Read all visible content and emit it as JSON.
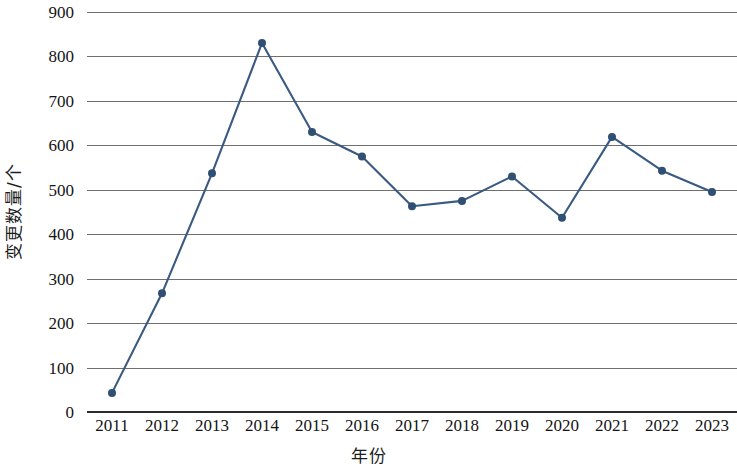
{
  "chart_data": {
    "type": "line",
    "title": "",
    "xlabel": "年份",
    "ylabel": "变更数量/个",
    "categories": [
      "2011",
      "2012",
      "2013",
      "2014",
      "2015",
      "2016",
      "2017",
      "2018",
      "2019",
      "2020",
      "2021",
      "2022",
      "2023"
    ],
    "values": [
      43,
      267,
      537,
      830,
      630,
      575,
      463,
      475,
      530,
      437,
      619,
      543,
      495
    ],
    "series": [
      {
        "name": "变更数量",
        "values": [
          43,
          267,
          537,
          830,
          630,
          575,
          463,
          475,
          530,
          437,
          619,
          543,
          495
        ]
      }
    ],
    "ylim": [
      0,
      900
    ],
    "ytick_labels": [
      "0",
      "100",
      "200",
      "300",
      "400",
      "500",
      "600",
      "700",
      "800",
      "900"
    ],
    "ytick_values": [
      0,
      100,
      200,
      300,
      400,
      500,
      600,
      700,
      800,
      900
    ],
    "ystep": 100,
    "grid": "horizontal",
    "legend": "none",
    "marker": "circle",
    "colors": {
      "line": "#3a5a82",
      "marker": "#2f4f73",
      "gridline": "#6f6f6f",
      "axis": "#2b2b2b",
      "text": "#141414"
    }
  }
}
